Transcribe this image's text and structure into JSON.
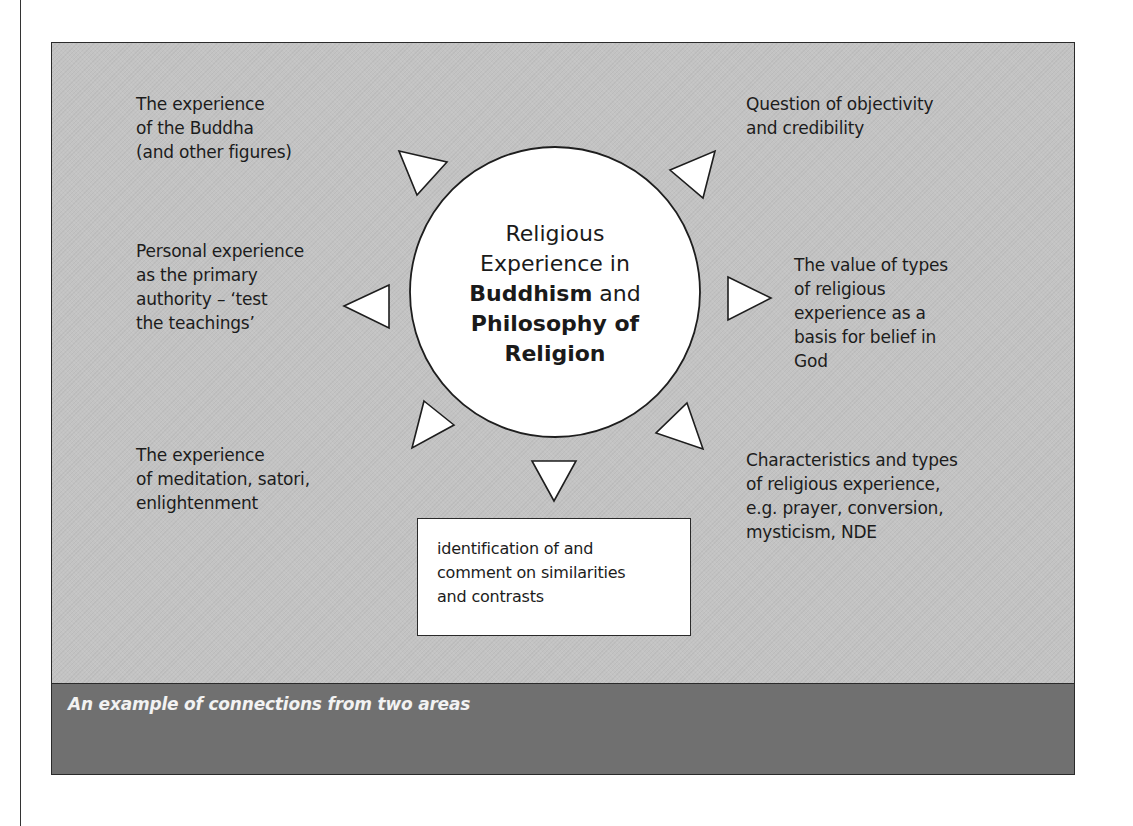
{
  "figure": {
    "background_color": "#c3c3c3",
    "caption_band_color": "#707070",
    "hub_fill": "#ffffff",
    "caption": "An example of connections from two areas"
  },
  "hub": {
    "line1": "Religious",
    "line2": "Experience in",
    "line3_bold": "Buddhism",
    "line3_rest": " and",
    "line4_bold": "Philosophy of",
    "line5_bold": "Religion"
  },
  "nodes": {
    "buddha_experience": "The experience\nof the Buddha\n(and other figures)",
    "personal_authority": "Personal experience\nas the primary\nauthority – ‘test\nthe teachings’",
    "meditation": "The experience\nof meditation, satori,\nenlightenment",
    "objectivity": "Question of objectivity\nand credibility",
    "value_of_types": "The value of types\nof religious\nexperience as a\nbasis for belief in\nGod",
    "characteristics": "Characteristics and types\nof religious experience,\ne.g. prayer, conversion,\nmysticism, NDE"
  },
  "summary_box": {
    "text": "identification of and\ncomment on similarities\nand contrasts"
  }
}
